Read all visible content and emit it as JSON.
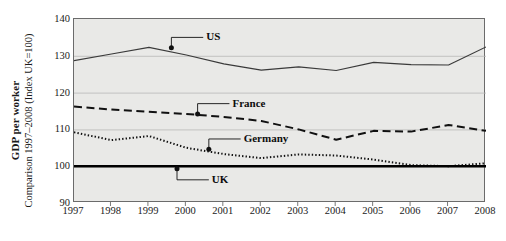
{
  "chart_data": {
    "type": "line",
    "title": "",
    "ylabel_bold": "GDP per worker",
    "ylabel_sub": "Comparison 1997–2008 (Index UK=100)",
    "xlabel": "",
    "categories": [
      "1997",
      "1998",
      "1999",
      "2000",
      "2001",
      "2002",
      "2003",
      "2004",
      "2005",
      "2006",
      "2007",
      "2008"
    ],
    "x": [
      1997,
      1998,
      1999,
      2000,
      2001,
      2002,
      2003,
      2004,
      2005,
      2006,
      2007,
      2008
    ],
    "ylim": [
      90,
      140
    ],
    "yticks": [
      90,
      100,
      110,
      120,
      130,
      140
    ],
    "grid": true,
    "legend": "inline-annotations",
    "series": [
      {
        "name": "US",
        "style": "solid-thin",
        "color": "#3a3a3a",
        "values": [
          128.7,
          130.5,
          132.3,
          130.2,
          127.8,
          126.1,
          127.0,
          126.0,
          128.2,
          127.6,
          127.5,
          132.4
        ]
      },
      {
        "name": "France",
        "style": "dashed",
        "color": "#111111",
        "values": [
          116.2,
          115.4,
          114.8,
          114.2,
          113.4,
          112.3,
          110.0,
          107.2,
          109.6,
          109.4,
          111.2,
          109.6
        ]
      },
      {
        "name": "Germany",
        "style": "dotted",
        "color": "#111111",
        "values": [
          109.2,
          107.1,
          108.2,
          105.0,
          103.3,
          102.2,
          103.2,
          102.9,
          101.8,
          100.3,
          100.0,
          100.8
        ]
      },
      {
        "name": "UK",
        "style": "solid-thick",
        "color": "#000000",
        "values": [
          100,
          100,
          100,
          100,
          100,
          100,
          100,
          100,
          100,
          100,
          100,
          100
        ]
      }
    ],
    "annotations": [
      {
        "label": "US",
        "marker_x": 1999.6,
        "marker_y": 132.2,
        "text_x": 2000.45,
        "text_y": 135.0
      },
      {
        "label": "France",
        "marker_x": 2000.3,
        "marker_y": 114.2,
        "text_x": 2001.15,
        "text_y": 117.0
      },
      {
        "label": "Germany",
        "marker_x": 2000.6,
        "marker_y": 104.6,
        "text_x": 2001.45,
        "text_y": 107.4
      },
      {
        "label": "UK",
        "marker_x": 1999.75,
        "marker_y": 99.3,
        "text_x": 2000.6,
        "text_y": 96.3
      }
    ]
  }
}
